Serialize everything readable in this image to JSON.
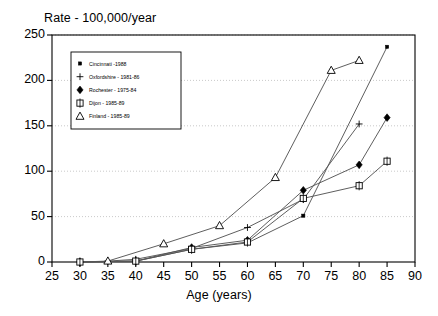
{
  "chart_data": {
    "type": "line",
    "title": "",
    "ylabel": "Rate - 100,000/year",
    "xlabel": "Age (years)",
    "xlim": [
      25,
      90
    ],
    "ylim": [
      0,
      250
    ],
    "xticks": [
      25,
      30,
      35,
      40,
      45,
      50,
      55,
      60,
      65,
      70,
      75,
      80,
      85,
      90
    ],
    "yticks": [
      0,
      50,
      100,
      150,
      200,
      250
    ],
    "grid": "horizontal-dotted",
    "legend_position": "upper-left-inside",
    "series": [
      {
        "name": "Cincinnati -1988",
        "marker": "small-filled-square",
        "x": [
          30,
          40,
          50,
          60,
          70,
          85
        ],
        "values": [
          0,
          1,
          14,
          21,
          51,
          237
        ]
      },
      {
        "name": "Oxfordshire - 1981-86",
        "marker": "plus",
        "x": [
          30,
          35,
          40,
          50,
          60,
          70,
          80
        ],
        "values": [
          0,
          1,
          3,
          15,
          38,
          69,
          152
        ]
      },
      {
        "name": "Rochester - 1975-84",
        "marker": "filled-diamond",
        "x": [
          30,
          40,
          50,
          60,
          70,
          80,
          85
        ],
        "values": [
          0,
          1,
          16,
          24,
          79,
          107,
          159
        ]
      },
      {
        "name": "Dijon - 1985-89",
        "marker": "open-square-dotted",
        "x": [
          30,
          40,
          50,
          60,
          70,
          80,
          85
        ],
        "values": [
          0,
          1,
          14,
          22,
          70,
          84,
          111
        ]
      },
      {
        "name": "Finland - 1985-89",
        "marker": "open-triangle",
        "x": [
          35,
          45,
          55,
          65,
          75,
          80
        ],
        "values": [
          1,
          20,
          40,
          93,
          211,
          222
        ]
      }
    ]
  },
  "legend": {
    "items": [
      {
        "label": "Cincinnati -1988"
      },
      {
        "label": "Oxfordshire - 1981-86"
      },
      {
        "label": "Rochester - 1975-84"
      },
      {
        "label": "Dijon - 1985-89"
      },
      {
        "label": "Finland - 1985-89"
      }
    ]
  },
  "colors": {
    "line": "#555555",
    "axis": "#000000",
    "grid": "#bbbbbb",
    "marker_fill": "#000000",
    "background": "#ffffff"
  }
}
